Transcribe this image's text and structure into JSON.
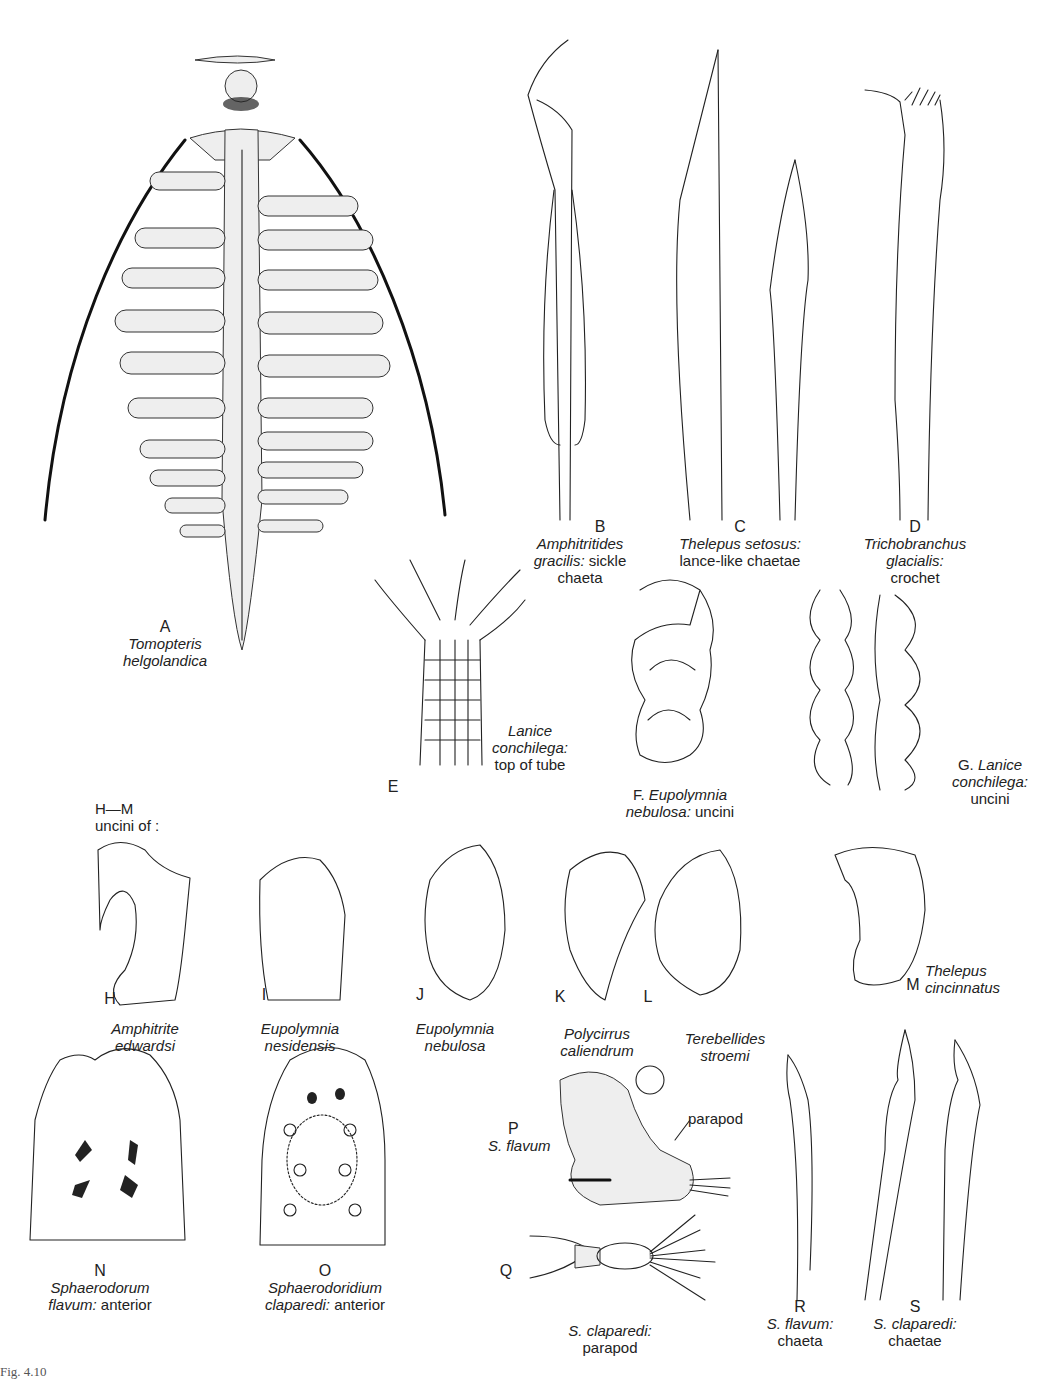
{
  "figure": {
    "caption": "Fig. 4.10",
    "panels": [
      {
        "id": "A",
        "letter": "A",
        "line1": "Tomopteris",
        "line2": "helgolandica",
        "line3": ""
      },
      {
        "id": "B",
        "letter": "B",
        "line1": "Amphitritides",
        "line2_italic": "gracilis:",
        "line2_plain": " sickle",
        "line3": "chaeta"
      },
      {
        "id": "C",
        "letter": "C",
        "line1": "Thelepus  setosus:",
        "line2": "lance-like chaetae"
      },
      {
        "id": "D",
        "letter": "D",
        "line1": "Trichobranchus",
        "line2": "glacialis:",
        "line3": "crochet"
      },
      {
        "id": "E",
        "letter": "E",
        "line1": "Lanice",
        "line2": "conchilega:",
        "line3": "top of tube"
      },
      {
        "id": "F",
        "letter": "F.",
        "line1": "Eupolymnia",
        "line2_italic": "nebulosa:",
        "line2_plain": " uncini"
      },
      {
        "id": "G",
        "letter": "G.",
        "line1": "Lanice",
        "line2": "conchilega:",
        "line3": "uncini"
      },
      {
        "id": "HM",
        "letter": "H—M",
        "line1": "uncini of :"
      },
      {
        "id": "H",
        "letter": "H",
        "line1": "Amphitrite",
        "line2": "edwardsi"
      },
      {
        "id": "I",
        "letter": "I",
        "line1": "Eupolymnia",
        "line2": "nesidensis"
      },
      {
        "id": "J",
        "letter": "J",
        "line1": "Eupolymnia",
        "line2": "nebulosa"
      },
      {
        "id": "K",
        "letter": "K",
        "line1": "Polycirrus",
        "line2": "caliendrum"
      },
      {
        "id": "L",
        "letter": "L",
        "line1": "Terebellides",
        "line2": "stroemi"
      },
      {
        "id": "M",
        "letter": "M",
        "line1": "Thelepus",
        "line2": "cincinnatus"
      },
      {
        "id": "N",
        "letter": "N",
        "line1": "Sphaerodorum",
        "line2_italic": "flavum:",
        "line2_plain": " anterior"
      },
      {
        "id": "O",
        "letter": "O",
        "line1": "Sphaerodoridium",
        "line2_italic": "claparedi:",
        "line2_plain": " anterior"
      },
      {
        "id": "P",
        "letter": "P",
        "line1": "S. flavum",
        "pointer": "parapod"
      },
      {
        "id": "Q",
        "letter": "Q",
        "line1": "S. claparedi:",
        "line2": "parapod"
      },
      {
        "id": "R",
        "letter": "R",
        "line1": "S. flavum:",
        "line2": "chaeta"
      },
      {
        "id": "S",
        "letter": "S",
        "line1": "S. claparedi:",
        "line2": "chaetae"
      }
    ]
  }
}
